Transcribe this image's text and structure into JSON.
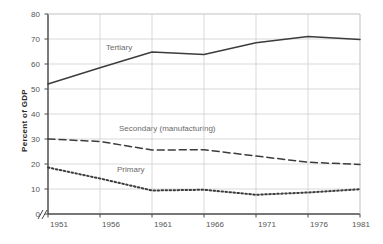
{
  "chart_data": {
    "type": "line",
    "title": "",
    "xlabel": "",
    "ylabel": "Percent of GDP",
    "x": [
      1951,
      1956,
      1961,
      1966,
      1971,
      1976,
      1981
    ],
    "xtick_labels": [
      "1951",
      "1956",
      "1961",
      "1966",
      "1971",
      "1976",
      "1981"
    ],
    "ytick_labels": [
      "0",
      "10",
      "20",
      "30",
      "40",
      "50",
      "60",
      "70",
      "80"
    ],
    "yticks": [
      0,
      10,
      20,
      30,
      40,
      50,
      60,
      70,
      80
    ],
    "ylim": [
      0,
      80
    ],
    "xlim": [
      1951,
      1981
    ],
    "grid": true,
    "legend_position": "inline-annotations",
    "axis_break": "//",
    "series": [
      {
        "name": "Tertiary",
        "label": "Tertiary",
        "style": "solid",
        "color": "#3c3c3c",
        "values": [
          52,
          58.5,
          64.8,
          63.8,
          68.5,
          71,
          69.8
        ]
      },
      {
        "name": "Secondary",
        "label": "Secondary (manufacturing)",
        "style": "dashed",
        "color": "#3c3c3c",
        "values": [
          30,
          29,
          25.6,
          25.7,
          23.2,
          20.7,
          19.8
        ]
      },
      {
        "name": "Primary",
        "label": "Primary",
        "style": "dotted",
        "color": "#3c3c3c",
        "values": [
          18.6,
          14.2,
          9.4,
          9.7,
          7.7,
          8.6,
          9.9
        ]
      }
    ],
    "annotations": [
      {
        "text": "Tertiary",
        "x_px": 106,
        "y_px": 47
      },
      {
        "text": "Secondary (manufacturing)",
        "x_px": 119,
        "y_px": 128
      },
      {
        "text": "Primary",
        "x_px": 117,
        "y_px": 169
      }
    ],
    "colors": {
      "grid": "#cfcfcf",
      "axis": "#4a4a4a",
      "line": "#3c3c3c",
      "tick_text": "#555555",
      "annotation_text": "#6a6a6a",
      "background": "#ffffff"
    }
  }
}
